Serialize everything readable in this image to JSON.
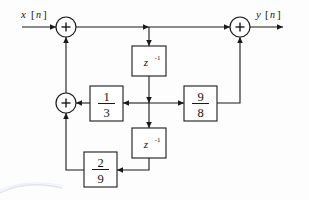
{
  "figure": {
    "type": "signal-flow-block-diagram",
    "domain": "discrete-time system / digital filter structure",
    "background_color": "#fdfdfd",
    "line_color": "#1a1a1a"
  },
  "io": {
    "input": {
      "var": "x",
      "open": "[",
      "index": "n",
      "close": "]",
      "full": "x[n]"
    },
    "output": {
      "var": "y",
      "open": "[",
      "index": "n",
      "close": "]",
      "full": "y[n]"
    }
  },
  "adders": [
    {
      "id": "adder-input",
      "symbol": "+",
      "cx": 66,
      "cy": 27
    },
    {
      "id": "adder-output",
      "symbol": "+",
      "cx": 240,
      "cy": 27
    },
    {
      "id": "adder-feedback",
      "symbol": "+",
      "cx": 66,
      "cy": 103
    }
  ],
  "delays": [
    {
      "id": "delay-1",
      "base": "z",
      "exponent": "-1",
      "label": "z^-1",
      "x": 132,
      "y": 46,
      "w": 34,
      "h": 30
    },
    {
      "id": "delay-2",
      "base": "z",
      "exponent": "-1",
      "label": "z^-1",
      "x": 132,
      "y": 128,
      "w": 34,
      "h": 30
    }
  ],
  "gains": [
    {
      "id": "gain-one-third",
      "numerator": "1",
      "denominator": "3",
      "label": "1/3",
      "x": 90,
      "y": 86,
      "w": 33,
      "h": 35
    },
    {
      "id": "gain-nine-eighths",
      "numerator": "9",
      "denominator": "8",
      "label": "9/8",
      "x": 184,
      "y": 86,
      "w": 33,
      "h": 35
    },
    {
      "id": "gain-two-ninths",
      "numerator": "2",
      "denominator": "9",
      "label": "2/9",
      "x": 84,
      "y": 152,
      "w": 33,
      "h": 35
    }
  ],
  "connections": [
    {
      "from": "x[n]",
      "to": "adder-input"
    },
    {
      "from": "adder-input",
      "to": "adder-output"
    },
    {
      "from": "adder-input-branch",
      "to": "delay-1"
    },
    {
      "from": "delay-1",
      "to": "center-junction"
    },
    {
      "from": "center-junction",
      "to": "gain-one-third"
    },
    {
      "from": "center-junction",
      "to": "gain-nine-eighths"
    },
    {
      "from": "center-junction",
      "to": "delay-2"
    },
    {
      "from": "gain-one-third",
      "to": "adder-feedback"
    },
    {
      "from": "gain-nine-eighths",
      "to": "adder-output"
    },
    {
      "from": "delay-2",
      "to": "gain-two-ninths"
    },
    {
      "from": "gain-two-ninths",
      "to": "adder-feedback"
    },
    {
      "from": "adder-feedback",
      "to": "adder-input"
    },
    {
      "from": "adder-output",
      "to": "y[n]"
    }
  ]
}
